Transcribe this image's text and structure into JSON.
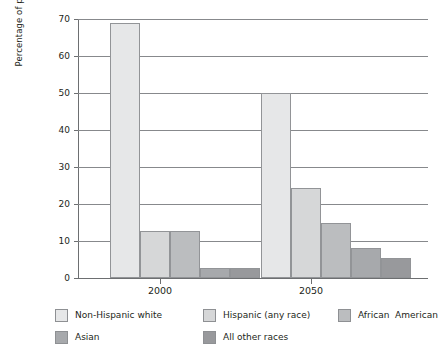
{
  "chart_data": {
    "type": "bar",
    "title": "",
    "subtitle": "",
    "xlabel": "",
    "ylabel": "Percentage of population",
    "categories": [
      "2000",
      "2050"
    ],
    "ylim": [
      0,
      70
    ],
    "yticks": [
      0,
      10,
      20,
      30,
      40,
      50,
      60,
      70
    ],
    "ytick_labels": [
      "0",
      "10",
      "20",
      "30",
      "40",
      "50",
      "60",
      "70"
    ],
    "grid": true,
    "legend_position": "bottom",
    "series": [
      {
        "name": "Non-Hispanic white",
        "color": "#e6e7e8",
        "values": [
          69,
          50
        ]
      },
      {
        "name": "Hispanic (any race)",
        "color": "#d6d7d8",
        "values": [
          12.6,
          24.4
        ]
      },
      {
        "name": "African  American",
        "color": "#bbbdbf",
        "values": [
          12.7,
          14.8
        ]
      },
      {
        "name": "Asian",
        "color": "#a7a9ac",
        "values": [
          2.8,
          8.1
        ]
      },
      {
        "name": "All other races",
        "color": "#98999c",
        "values": [
          2.8,
          5.3
        ]
      }
    ]
  },
  "axis": {
    "y_title": "Percentage of population",
    "y_tick_0": "0",
    "y_tick_10": "10",
    "y_tick_20": "20",
    "y_tick_30": "30",
    "y_tick_40": "40",
    "y_tick_50": "50",
    "y_tick_60": "60",
    "y_tick_70": "70",
    "x_tick_1": "2000",
    "x_tick_2": "2050"
  },
  "legend": {
    "items": [
      {
        "label": "Non-Hispanic white",
        "color": "#e6e7e8"
      },
      {
        "label": "Hispanic (any race)",
        "color": "#d6d7d8"
      },
      {
        "label": "African  American",
        "color": "#bbbdbf"
      },
      {
        "label": "Asian",
        "color": "#a7a9ac"
      },
      {
        "label": "All other races",
        "color": "#98999c"
      }
    ]
  },
  "colors": {
    "gridline": "#87898c",
    "axis": "#6d6f71",
    "bar_border": "#929497",
    "text": "#231f20",
    "background": "#ffffff"
  }
}
